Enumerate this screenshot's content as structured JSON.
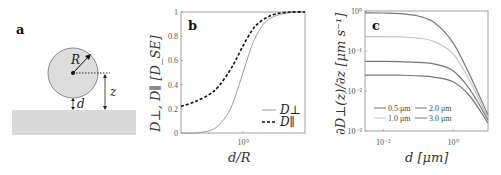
{
  "figure": {
    "panels": [
      "a",
      "b",
      "c"
    ]
  },
  "diagram_a": {
    "label": "a",
    "sphere_label": "R",
    "height_label": "z",
    "gap_label": "d",
    "colors": {
      "sphere_fill": "#dcdcdc",
      "sphere_stroke": "#8a8a8a",
      "floor": "#d9d9d9"
    }
  },
  "chart_data": [
    {
      "panel": "b",
      "type": "line",
      "title": "",
      "xlabel": "d/R",
      "ylabel": "D⊥, D∥ [D_SE]",
      "xscale": "log",
      "xlim": [
        0.05,
        20
      ],
      "ylim": [
        0,
        1
      ],
      "x_ticks": [
        {
          "value": 1,
          "label": "10⁰"
        }
      ],
      "y_ticks": [
        "0",
        "0.2",
        "0.4",
        "0.6",
        "0.8",
        "1"
      ],
      "legend_position": "lower right",
      "series": [
        {
          "name": "D⊥",
          "style": "solid",
          "color": "#9a9a9a",
          "x": [
            0.05,
            0.1,
            0.2,
            0.3,
            0.5,
            0.7,
            1.0,
            1.5,
            2.0,
            3.0,
            5.0,
            10.0,
            20.0
          ],
          "values": [
            0.0,
            0.0,
            0.02,
            0.06,
            0.17,
            0.31,
            0.5,
            0.71,
            0.82,
            0.92,
            0.97,
            0.995,
            1.0
          ]
        },
        {
          "name": "D∥",
          "style": "dashed",
          "color": "#111111",
          "x": [
            0.05,
            0.1,
            0.2,
            0.3,
            0.5,
            0.7,
            1.0,
            1.5,
            2.0,
            3.0,
            5.0,
            10.0,
            20.0
          ],
          "values": [
            0.22,
            0.26,
            0.32,
            0.38,
            0.5,
            0.6,
            0.72,
            0.84,
            0.9,
            0.95,
            0.985,
            1.0,
            1.0
          ]
        }
      ]
    },
    {
      "panel": "c",
      "type": "line",
      "title": "",
      "xlabel": "d [μm]",
      "ylabel": "∂D⊥(z)/∂z [μm s⁻¹]",
      "xscale": "log",
      "yscale": "log",
      "xlim": [
        0.003,
        10
      ],
      "ylim": [
        0.001,
        1
      ],
      "x_ticks": [
        {
          "value": 0.01,
          "label": "10⁻²"
        },
        {
          "value": 1,
          "label": "10⁰"
        }
      ],
      "y_ticks": [
        {
          "value": 1,
          "label": "10⁰"
        },
        {
          "value": 0.1,
          "label": "10⁻¹"
        },
        {
          "value": 0.01,
          "label": "10⁻²"
        },
        {
          "value": 0.001,
          "label": "10⁻³"
        }
      ],
      "legend_position": "lower center",
      "series": [
        {
          "name": "0.5 μm",
          "color": "#777777",
          "x": [
            0.003,
            0.01,
            0.03,
            0.1,
            0.3,
            1,
            3,
            10
          ],
          "values": [
            0.9,
            0.89,
            0.86,
            0.75,
            0.5,
            0.16,
            0.025,
            0.0025
          ]
        },
        {
          "name": "1.0 μm",
          "color": "#c4c4c4",
          "x": [
            0.003,
            0.01,
            0.03,
            0.1,
            0.3,
            1,
            3,
            10
          ],
          "values": [
            0.23,
            0.228,
            0.225,
            0.21,
            0.17,
            0.085,
            0.018,
            0.0021
          ]
        },
        {
          "name": "2.0 μm",
          "color": "#777777",
          "x": [
            0.003,
            0.01,
            0.03,
            0.1,
            0.3,
            1,
            3,
            10
          ],
          "values": [
            0.055,
            0.055,
            0.054,
            0.052,
            0.047,
            0.032,
            0.011,
            0.0019
          ]
        },
        {
          "name": "3.0 μm",
          "color": "#777777",
          "x": [
            0.003,
            0.01,
            0.03,
            0.1,
            0.3,
            1,
            3,
            10
          ],
          "values": [
            0.025,
            0.025,
            0.0248,
            0.024,
            0.022,
            0.017,
            0.0075,
            0.0016
          ]
        }
      ]
    }
  ]
}
